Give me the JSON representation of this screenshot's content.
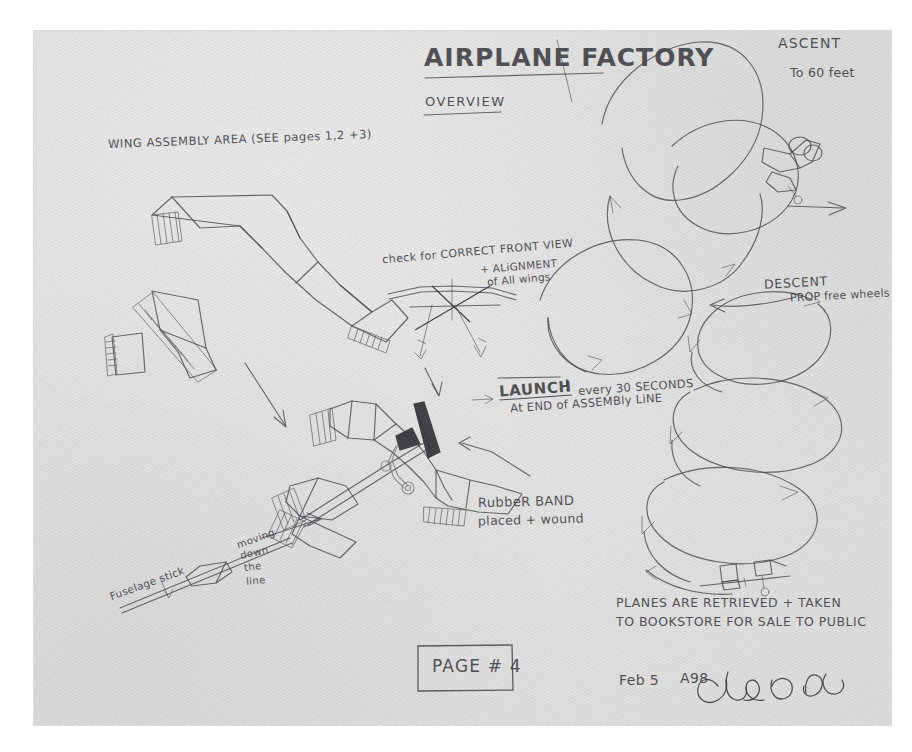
{
  "document": {
    "medium": "pencil on paper",
    "title": "AiRPLANE FactoRY",
    "subtitle": "OVERVIEW",
    "page_label": "PAGE # 4",
    "signature_date": "Feb 5",
    "signature_year": "A98",
    "signature_name": "Chris Burden"
  },
  "annotations": {
    "wing_assembly": "WING ASSEMBLY AREA (SEE pages 1,2 +3)",
    "front_view_line1": "check for CORRECT FRONT VIEW",
    "front_view_line2": "+ ALiGNMENT",
    "front_view_line3": "of All wings",
    "launch_label": "LAUNCH",
    "launch_bang": "!",
    "launch_line1": "every 30 SECONDS",
    "launch_line2": "At END of ASSEMBly LiNE",
    "rubber_band_line1": "RubbeR BAND",
    "rubber_band_line2": "placed + wound",
    "fuselage_stick": "Fuselage stick",
    "moving_line1": "moving",
    "moving_line2": "down",
    "moving_line3": "the",
    "moving_line4": "line",
    "ascent_title": "ASCENT",
    "ascent_detail": "To 60 feet",
    "descent_title": "DESCENT",
    "descent_detail": "PROP free wheels",
    "retrieval_line1": "PLANES ARE RETRIEVED + TAKEN",
    "retrieval_line2": "To BookSTORE FOR SALE To PUBLiC"
  },
  "drawing_elements": {
    "wing_panels": "hatched quadrilateral wing blanks",
    "front_view_sketch": "front elevation of plane with dark propeller",
    "assembled_plane": "completed rubber-band plane on fuselage stick",
    "flight_path": "spiral ascent and descent trajectory",
    "ascent_plane": "small plane icon climbing",
    "landed_plane": "small plane icon on ground",
    "page_box": "rectangle around page number"
  },
  "colors": {
    "paper": "#e4e4e4",
    "ink": "#3d3d42",
    "graphite_dark": "#3a3a3e",
    "mount": "#ffffff"
  }
}
